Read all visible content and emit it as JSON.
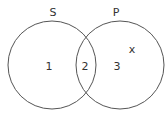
{
  "diagram": {
    "type": "venn",
    "sets": [
      {
        "name": "S",
        "label": "S"
      },
      {
        "name": "P",
        "label": "P"
      }
    ],
    "regions": {
      "r1": "1",
      "r2": "2",
      "r3": "3"
    },
    "marker": "x",
    "stroke_color": "#555555"
  }
}
